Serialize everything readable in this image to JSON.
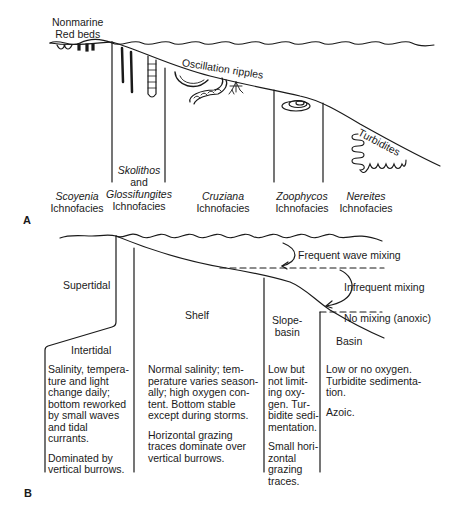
{
  "panel_a": {
    "letter": "A",
    "top_label_line1": "Nonmarine",
    "top_label_line2": "Red beds",
    "oscillation_label": "Oscillation ripples",
    "turbidites_label": "Turbidites",
    "ichnofacies": [
      {
        "name": "Scoyenia",
        "suffix": "Ichnofacies"
      },
      {
        "name_line1": "Skolithos",
        "connector": "and",
        "name": "Glossifungites",
        "suffix": "Ichnofacies"
      },
      {
        "name": "Cruziana",
        "suffix": "Ichnofacies"
      },
      {
        "name": "Zoophycos",
        "suffix": "Ichnofacies"
      },
      {
        "name": "Nereites",
        "suffix": "Ichnofacies"
      }
    ]
  },
  "panel_b": {
    "letter": "B",
    "mixing": {
      "frequent": "Frequent wave mixing",
      "infrequent": "Infrequent mixing",
      "none": "No mixing (anoxic)"
    },
    "zones": {
      "supertidal": "Supertidal",
      "intertidal": "Intertidal",
      "shelf": "Shelf",
      "slope_line1": "Slope-",
      "slope_line2": "basin",
      "basin": "Basin"
    },
    "descriptions": {
      "intertidal": {
        "p1": [
          "Salinity, tempera-",
          "ture and light",
          "change daily;",
          "bottom reworked",
          "by small waves",
          "and tidal",
          "currants."
        ],
        "p2": [
          "Dominated by",
          "vertical burrows."
        ]
      },
      "shelf": {
        "p1": [
          "Normal salinity; tem-",
          "perature varies season-",
          "ally; high oxygen con-",
          "tent.  Bottom stable",
          "except during storms."
        ],
        "p2": [
          "Horizontal grazing",
          "traces dominate over",
          "vertical burrows."
        ]
      },
      "slope": {
        "p1": [
          "Low but",
          "not limit-",
          "ing oxy-",
          "gen. Tur-",
          "bidite sedi-",
          "mentation."
        ],
        "p2": [
          "Small hori-",
          "zontal",
          "grazing",
          "traces."
        ]
      },
      "basin": {
        "p1": [
          "Low or no oxygen.",
          "Turbidite sedimenta-",
          "tion."
        ],
        "p2": [
          "Azoic."
        ]
      }
    }
  }
}
